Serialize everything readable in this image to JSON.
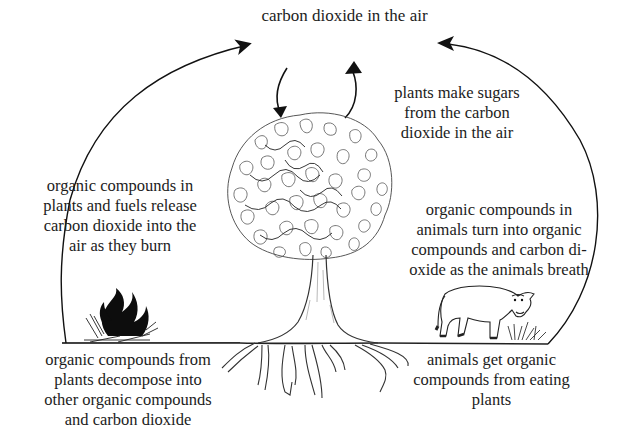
{
  "diagram": {
    "colors": {
      "ink": "#1a1a1a",
      "background": "#ffffff"
    },
    "nodes": {
      "air": {
        "label": "carbon dioxide in the air"
      },
      "photosynthesis": {
        "lines": [
          "plants make sugars",
          "from the carbon",
          "dioxide in the air"
        ]
      },
      "combustion": {
        "lines": [
          "organic compounds in",
          "plants and fuels release",
          "carbon dioxide into the",
          "air as they burn"
        ]
      },
      "respiration": {
        "lines": [
          "organic compounds in",
          "animals turn into organic",
          "compounds and carbon di-",
          "oxide as the animals breath"
        ]
      },
      "decomposition": {
        "lines": [
          "organic compounds from",
          "plants decompose into",
          "other organic compounds",
          "and carbon dioxide"
        ]
      },
      "consumption": {
        "lines": [
          "animals get organic",
          "compounds from eating",
          "plants"
        ]
      }
    },
    "illustrations": [
      "tree-icon",
      "fire-icon",
      "cow-icon",
      "grass-icon",
      "roots-icon"
    ],
    "edges": [
      {
        "from": "fire",
        "to": "air",
        "shape": "arc-left"
      },
      {
        "from": "ground-right",
        "to": "air",
        "shape": "arc-right"
      },
      {
        "from": "air",
        "to": "tree",
        "shape": "curved-down"
      },
      {
        "from": "tree",
        "to": "air",
        "shape": "curved-up"
      }
    ]
  }
}
